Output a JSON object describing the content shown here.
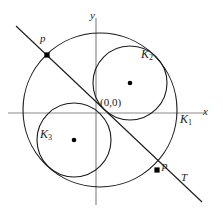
{
  "figure": {
    "background_color": "#ffffff",
    "stroke_color": "#1a1a1a",
    "axis_color": "#8a8a8a",
    "point_color": "#000000",
    "width": 223,
    "height": 212
  },
  "axes": {
    "origin_label": "(0,0)",
    "x_label": "x",
    "y_label": "y",
    "origin_px": {
      "x": 96,
      "y": 113
    },
    "x_axis": {
      "x1": 8,
      "y1": 113,
      "x2": 205,
      "y2": 113
    },
    "y_axis": {
      "x1": 96,
      "y1": 18,
      "x2": 96,
      "y2": 205
    }
  },
  "circles": [
    {
      "name": "K1",
      "label": "K",
      "subscript": "1",
      "cx": 100,
      "cy": 110,
      "r": 77,
      "label_x": 180,
      "label_y": 120,
      "has_center_dot": false
    },
    {
      "name": "K2",
      "label": "K",
      "subscript": "2",
      "cx": 130,
      "cy": 83,
      "r": 37,
      "label_x": 141,
      "label_y": 54,
      "has_center_dot": true,
      "dot_x": 130,
      "dot_y": 83
    },
    {
      "name": "K3",
      "label": "K",
      "subscript": "3",
      "cx": 74,
      "cy": 140,
      "r": 37,
      "label_x": 40,
      "label_y": 134,
      "has_center_dot": true,
      "dot_x": 74,
      "dot_y": 140
    }
  ],
  "tangent_line": {
    "label": "T",
    "label_x": 181,
    "label_y": 178,
    "x1": 16,
    "y1": 26,
    "x2": 202,
    "y2": 202
  },
  "points": [
    {
      "name": "p-upper",
      "label": "p",
      "x": 47,
      "y": 55,
      "label_x": 38,
      "label_y": 36
    },
    {
      "name": "p-lower",
      "label": "p",
      "x": 157,
      "y": 170,
      "label_x": 162,
      "label_y": 163
    }
  ]
}
